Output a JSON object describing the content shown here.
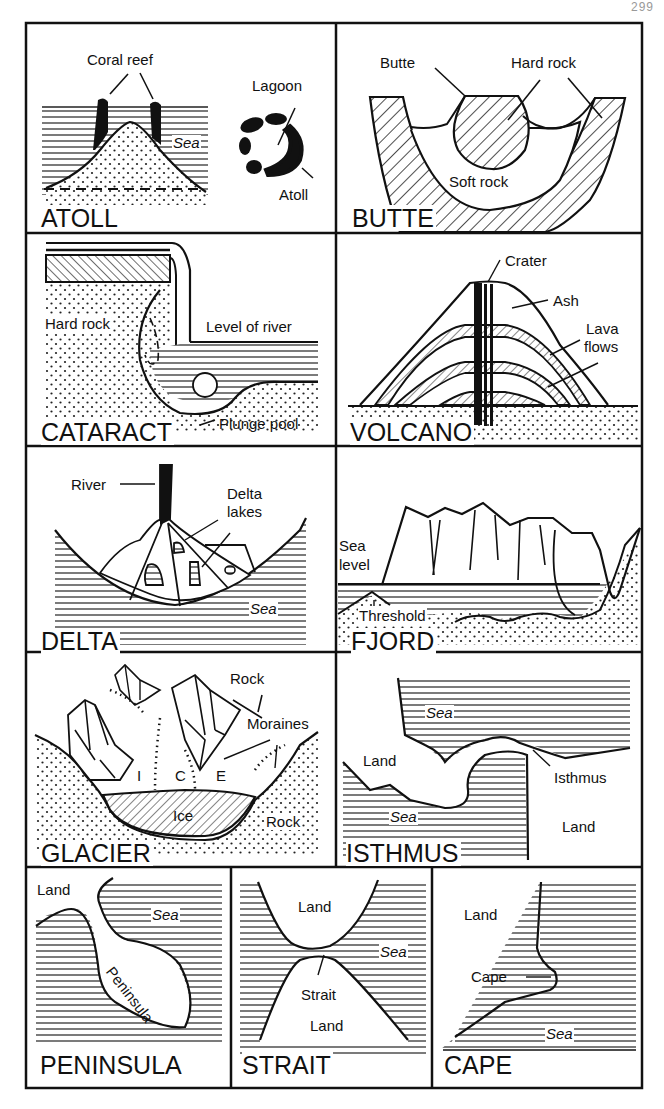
{
  "page": {
    "number": "299"
  },
  "panels": {
    "atoll": {
      "title": "ATOLL",
      "labels": {
        "coral_reef": "Coral reef",
        "sea": "Sea",
        "lagoon": "Lagoon",
        "atoll": "Atoll"
      }
    },
    "butte": {
      "title": "BUTTE",
      "labels": {
        "butte": "Butte",
        "hard_rock": "Hard rock",
        "soft_rock": "Soft rock"
      }
    },
    "cataract": {
      "title": "CATARACT",
      "labels": {
        "hard_rock": "Hard rock",
        "level_of_river": "Level of river",
        "plunge_pool": "Plunge pool"
      }
    },
    "volcano": {
      "title": "VOLCANO",
      "labels": {
        "crater": "Crater",
        "ash": "Ash",
        "lava": "Lava",
        "flows": "flows"
      }
    },
    "delta": {
      "title": "DELTA",
      "labels": {
        "river": "River",
        "delta": "Delta",
        "lakes": "lakes",
        "sea": "Sea"
      }
    },
    "fjord": {
      "title": "FJORD",
      "labels": {
        "sea": "Sea",
        "level": "level",
        "threshold": "Threshold"
      }
    },
    "glacier": {
      "title": "GLACIER",
      "labels": {
        "rock_top": "Rock",
        "moraines": "Moraines",
        "i": "I",
        "c": "C",
        "e": "E",
        "ice": "Ice",
        "rock_bottom": "Rock"
      }
    },
    "isthmus": {
      "title": "ISTHMUS",
      "labels": {
        "sea_top": "Sea",
        "land_left": "Land",
        "isthmus": "Isthmus",
        "sea_bottom": "Sea",
        "land_right": "Land"
      }
    },
    "peninsula": {
      "title": "PENINSULA",
      "labels": {
        "land": "Land",
        "sea": "Sea",
        "peninsula": "Peninsula"
      }
    },
    "strait": {
      "title": "STRAIT",
      "labels": {
        "land_top": "Land",
        "sea": "Sea",
        "strait": "Strait",
        "land_bottom": "Land"
      }
    },
    "cape": {
      "title": "CAPE",
      "labels": {
        "land": "Land",
        "cape": "Cape",
        "sea": "Sea"
      }
    }
  }
}
